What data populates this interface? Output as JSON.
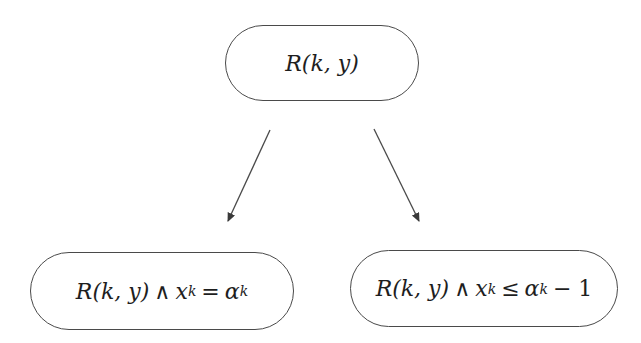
{
  "diagram": {
    "type": "tree",
    "nodes": [
      {
        "id": "root",
        "label": "R(k, y)",
        "parts": {
          "pred": "R",
          "args": "(k, y)"
        }
      },
      {
        "id": "left",
        "label": "R(k, y) ∧ x_k = α_k",
        "parts": {
          "pred": "R",
          "args": "(k, y)",
          "and": "∧",
          "var": "x",
          "var_sub": "k",
          "rel": "=",
          "rhs": "α",
          "rhs_sub": "k",
          "tail": ""
        }
      },
      {
        "id": "right",
        "label": "R(k, y) ∧ x_k ≤ α_k − 1",
        "parts": {
          "pred": "R",
          "args": "(k, y)",
          "and": "∧",
          "var": "x",
          "var_sub": "k",
          "rel": "≤",
          "rhs": "α",
          "rhs_sub": "k",
          "tail": "− 1"
        }
      }
    ],
    "edges": [
      {
        "from": "root",
        "to": "left"
      },
      {
        "from": "root",
        "to": "right"
      }
    ],
    "colors": {
      "stroke": "#4a4a4a",
      "text": "#1e1e1e",
      "background": "#ffffff"
    }
  }
}
